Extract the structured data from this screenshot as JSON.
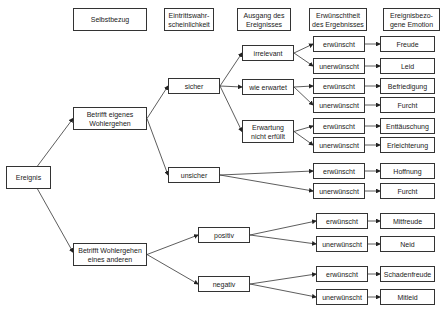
{
  "headers": [
    {
      "id": "h1",
      "label": "Selbstbezug"
    },
    {
      "id": "h2",
      "label": "Eintrittswahr-\nscheinlichkeit"
    },
    {
      "id": "h3",
      "label": "Ausgang des\nEreignisses"
    },
    {
      "id": "h4",
      "label": "Erwünschtheit\ndes Ergebnisses"
    },
    {
      "id": "h5",
      "label": "Ereignisbezo-\ngene Emotion"
    }
  ],
  "nodes": {
    "ereignis": "Ereignis",
    "eigenes": "Betrifft eigenes\nWohlergehen",
    "anderen": "Betrifft Wohlergehen\neines anderen",
    "sicher": "sicher",
    "unsicher": "unsicher",
    "positiv": "positiv",
    "negativ": "negativ",
    "irrelevant": "irrelevant",
    "wie_erwartet": "wie erwartet",
    "nicht_erfuellt": "Erwartung\nnicht erfüllt",
    "d1": "erwünscht",
    "d2": "unerwünscht",
    "d3": "erwünscht",
    "d4": "unerwünscht",
    "d5": "erwünscht",
    "d6": "unerwünscht",
    "d7": "erwünscht",
    "d8": "unerwünscht",
    "d9": "erwünscht",
    "d10": "unerwünscht",
    "d11": "erwünscht",
    "d12": "unerwünscht",
    "e1": "Freude",
    "e2": "Leid",
    "e3": "Befriedigung",
    "e4": "Furcht",
    "e5": "Enttäuschung",
    "e6": "Erleichterung",
    "e7": "Hoffnung",
    "e8": "Furcht",
    "e9": "Mitfreude",
    "e10": "Neid",
    "e11": "Schadenfreude",
    "e12": "Mitleid"
  }
}
